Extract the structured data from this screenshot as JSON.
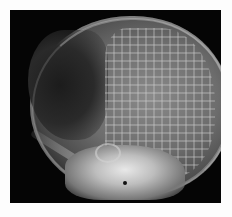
{
  "image": {
    "subject": "Lateral skull X-ray with cranioplasty mesh",
    "description": "Grayscale radiograph of a skull in lateral view; a regular grid mesh overlays the parietal region, skull base bright at lower center."
  }
}
